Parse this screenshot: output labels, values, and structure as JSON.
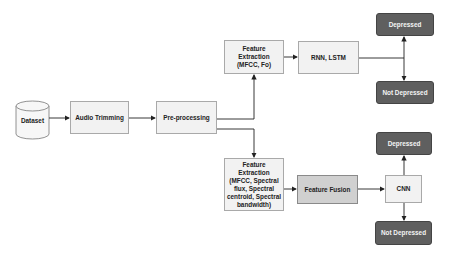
{
  "diagram": {
    "nodes": {
      "dataset": "Dataset",
      "audio_trimming": "Audio Trimming",
      "preprocessing": "Pre-processing",
      "feature_extraction_top": "Feature Extraction (MFCC, Fo)",
      "rnn_lstm": "RNN, LSTM",
      "depressed_top": "Depressed",
      "not_depressed_top": "Not Depressed",
      "feature_extraction_bottom": "Feature Extraction (MFCC, Spectral flux, Spectral centroid, Spectral bandwidth)",
      "feature_fusion": "Feature Fusion",
      "cnn": "CNN",
      "depressed_bottom": "Depressed",
      "not_depressed_bottom": "Not Depressed"
    },
    "edges": [
      [
        "dataset",
        "audio_trimming"
      ],
      [
        "audio_trimming",
        "preprocessing"
      ],
      [
        "preprocessing",
        "feature_extraction_top"
      ],
      [
        "preprocessing",
        "feature_extraction_bottom"
      ],
      [
        "feature_extraction_top",
        "rnn_lstm"
      ],
      [
        "rnn_lstm",
        "depressed_top"
      ],
      [
        "rnn_lstm",
        "not_depressed_top"
      ],
      [
        "feature_extraction_bottom",
        "feature_fusion"
      ],
      [
        "feature_fusion",
        "cnn"
      ],
      [
        "cnn",
        "depressed_bottom"
      ],
      [
        "cnn",
        "not_depressed_bottom"
      ]
    ],
    "colors": {
      "light_fill": "#f2f2f2",
      "mid_fill": "#d0d0d0",
      "dark_fill": "#5f5f5f",
      "line": "#222222"
    }
  }
}
